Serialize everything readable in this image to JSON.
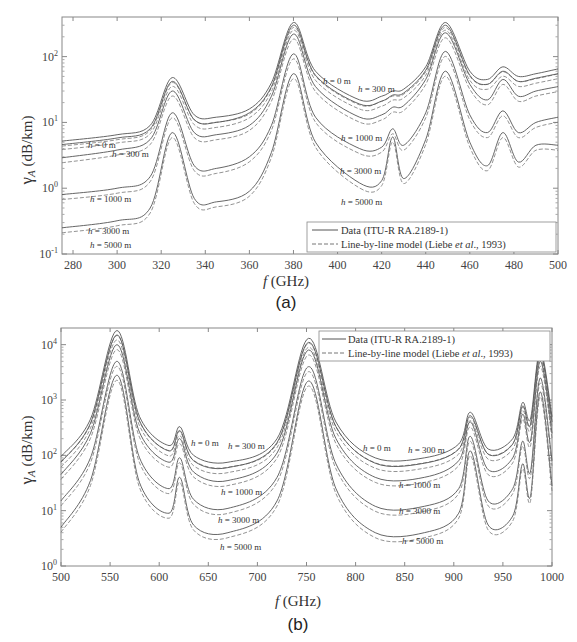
{
  "chart_data": [
    {
      "type": "line",
      "panel_label": "(a)",
      "xlabel": "f (GHz)",
      "ylabel": "γA (dB/km)",
      "yscale": "log",
      "xlim": [
        275,
        500
      ],
      "ylim": [
        0.1,
        400
      ],
      "x_ticks": [
        "280",
        "300",
        "320",
        "340",
        "360",
        "380",
        "400",
        "420",
        "440",
        "460",
        "480",
        "500"
      ],
      "y_ticks": [
        "10^-1",
        "10^0",
        "10^1",
        "10^2"
      ],
      "legend": {
        "position": "lower right",
        "entries": [
          "Data (ITU-R RA.2189-1)",
          "Line-by-line model (Liebe et al., 1993)"
        ]
      },
      "annotations": [
        "h = 0 m",
        "h = 300 m",
        "h = 1000 m",
        "h = 3000 m",
        "h = 5000 m"
      ],
      "x": [
        275,
        300,
        315,
        325,
        335,
        345,
        360,
        370,
        380,
        390,
        410,
        420,
        425,
        430,
        440,
        449,
        460,
        468,
        475,
        482,
        490,
        500
      ],
      "series": [
        {
          "name": "Data h=0 m",
          "values": [
            5.2,
            6.5,
            9,
            48,
            13,
            12,
            16,
            40,
            330,
            60,
            22,
            25,
            30,
            32,
            70,
            330,
            60,
            45,
            70,
            50,
            55,
            65
          ]
        },
        {
          "name": "Data h=300 m",
          "values": [
            4.6,
            5.8,
            8,
            42,
            11,
            10,
            14,
            35,
            300,
            52,
            19,
            21,
            26,
            28,
            62,
            300,
            52,
            38,
            60,
            42,
            47,
            55
          ]
        },
        {
          "name": "Data h=1000 m",
          "values": [
            2.9,
            3.8,
            5.5,
            30,
            7,
            6.5,
            9,
            25,
            220,
            35,
            12,
            13,
            17,
            18,
            45,
            230,
            38,
            22,
            45,
            25,
            30,
            35
          ]
        },
        {
          "name": "Data h=3000 m",
          "values": [
            0.8,
            1.0,
            1.5,
            14,
            2.2,
            2.0,
            3,
            9,
            110,
            12,
            4,
            4.2,
            8,
            4.5,
            14,
            120,
            13,
            7,
            15,
            7,
            10,
            12
          ]
        },
        {
          "name": "Data h=5000 m",
          "values": [
            0.25,
            0.32,
            0.5,
            7,
            0.7,
            0.62,
            0.9,
            3.5,
            55,
            5,
            1.2,
            1.3,
            6,
            1.4,
            5.5,
            60,
            5,
            2.2,
            7,
            2.5,
            4.5,
            4.5
          ]
        }
      ]
    },
    {
      "type": "line",
      "panel_label": "(b)",
      "xlabel": "f (GHz)",
      "ylabel": "γA (dB/km)",
      "yscale": "log",
      "xlim": [
        500,
        1000
      ],
      "ylim": [
        1,
        20000
      ],
      "x_ticks": [
        "500",
        "550",
        "600",
        "650",
        "700",
        "750",
        "800",
        "850",
        "900",
        "950",
        "1000"
      ],
      "y_ticks": [
        "10^0",
        "10^1",
        "10^2",
        "10^3",
        "10^4"
      ],
      "legend": {
        "position": "upper right",
        "entries": [
          "Data (ITU-R RA.2189-1)",
          "Line-by-line model (Liebe et al., 1993)"
        ]
      },
      "annotations": [
        "h = 0 m",
        "h = 300 m",
        "h = 1000 m",
        "h = 3000 m",
        "h = 5000 m"
      ],
      "x": [
        500,
        530,
        557,
        580,
        610,
        621,
        635,
        670,
        720,
        752,
        780,
        820,
        870,
        905,
        917,
        935,
        960,
        970,
        978,
        988,
        1000
      ],
      "series": [
        {
          "name": "Data h=0 m",
          "values": [
            95,
            450,
            18000,
            500,
            150,
            330,
            100,
            75,
            200,
            13000,
            400,
            90,
            90,
            160,
            600,
            130,
            200,
            900,
            450,
            8000,
            500
          ]
        },
        {
          "name": "Data h=300 m",
          "values": [
            75,
            380,
            15000,
            420,
            120,
            280,
            80,
            60,
            170,
            11000,
            330,
            72,
            72,
            130,
            520,
            105,
            160,
            780,
            350,
            7000,
            400
          ]
        },
        {
          "name": "Data h=1000 m",
          "values": [
            45,
            250,
            10000,
            260,
            75,
            200,
            50,
            35,
            110,
            8000,
            200,
            40,
            40,
            80,
            400,
            55,
            90,
            550,
            180,
            5000,
            250
          ]
        },
        {
          "name": "Data h=3000 m",
          "values": [
            15,
            90,
            5000,
            90,
            25,
            90,
            16,
            11,
            40,
            4000,
            70,
            12,
            12,
            25,
            220,
            15,
            25,
            180,
            50,
            2500,
            80
          ]
        },
        {
          "name": "Data h=5000 m",
          "values": [
            5,
            35,
            2800,
            32,
            9,
            40,
            5.5,
            4,
            15,
            2200,
            25,
            4,
            4,
            9,
            120,
            5.5,
            8,
            70,
            18,
            1400,
            28
          ]
        }
      ]
    }
  ],
  "figure": {
    "a": {
      "ylabel_main": "γ",
      "ylabel_sub": "A",
      "ylabel_units": " (dB/km)",
      "xlabel_f": "f",
      "xlabel_units": " (GHz)",
      "panel": "(a)",
      "legend1": "Data (ITU-R RA.2189-1)",
      "legend2_pre": "Line-by-line model (Liebe ",
      "legend2_it": "et al",
      "legend2_post": "., 1993)",
      "ann": [
        "h = 0 m",
        "h = 300 m",
        "h = 1000 m",
        "h = 3000 m",
        "h = 5000 m",
        "h = 0 m",
        "h = 300 m",
        "h = 1000 m",
        "h = 3000 m",
        "h = 5000 m"
      ]
    },
    "b": {
      "ylabel_main": "γ",
      "ylabel_sub": "A",
      "ylabel_units": " (dB/km)",
      "xlabel_f": "f",
      "xlabel_units": " (GHz)",
      "panel": "(b)",
      "legend1": "Data (ITU-R RA.2189-1)",
      "legend2_pre": "Line-by-line model (Liebe ",
      "legend2_it": "et al",
      "legend2_post": "., 1993)",
      "ann": [
        "h = 0 m",
        "h = 300 m",
        "h = 1000 m",
        "h = 3000 m",
        "h = 5000 m",
        "h = 0 m",
        "h = 300 m",
        "h = 1000 m",
        "h = 3000 m",
        "h = 5000 m"
      ]
    }
  }
}
